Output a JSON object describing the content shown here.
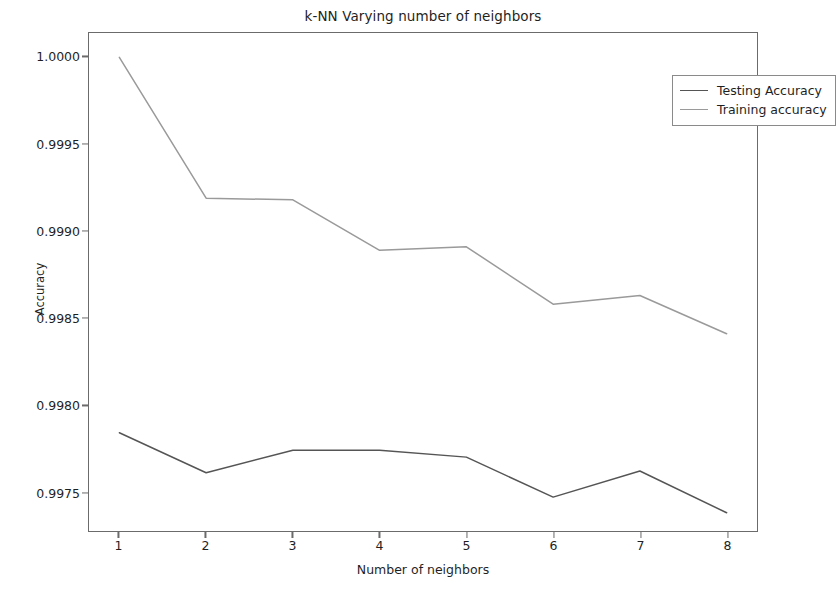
{
  "chart_data": {
    "type": "line",
    "title": "k-NN Varying number of neighbors",
    "xlabel": "Number of neighbors",
    "ylabel": "Accuracy",
    "x": [
      1,
      2,
      3,
      4,
      5,
      6,
      7,
      8
    ],
    "xticklabels": [
      "1",
      "2",
      "3",
      "4",
      "5",
      "6",
      "7",
      "8"
    ],
    "yticks": [
      1.0,
      0.9995,
      0.999,
      0.9985,
      0.998,
      0.9975
    ],
    "yticklabels": [
      "1.0000",
      "0.9995",
      "0.9990",
      "0.9985",
      "0.9980",
      "0.9975"
    ],
    "xlim": [
      0.65,
      8.35
    ],
    "ylim": [
      0.997275,
      1.00014
    ],
    "grid": false,
    "legend_position": "upper right",
    "series": [
      {
        "name": "Testing Accuracy",
        "color": "#555555",
        "values": [
          0.99784,
          0.99761,
          0.99774,
          0.99774,
          0.9977,
          0.99747,
          0.99762,
          0.99738
        ]
      },
      {
        "name": "Training accuracy",
        "color": "#9a9a9a",
        "values": [
          1.0,
          0.99919,
          0.99918,
          0.99889,
          0.99891,
          0.99858,
          0.99863,
          0.99841
        ]
      }
    ]
  }
}
